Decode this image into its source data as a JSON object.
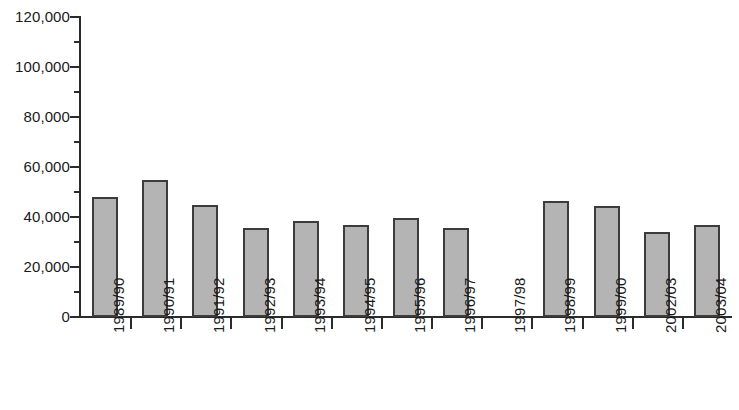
{
  "chart_data": {
    "type": "bar",
    "title": "",
    "subtitle": "",
    "xlabel": "",
    "ylabel": "",
    "grid": false,
    "legend": "none",
    "ylim": [
      0,
      120000
    ],
    "y_tick_step": 20000,
    "y_minor_tick_step": 10000,
    "y_ticks": [
      0,
      20000,
      40000,
      60000,
      80000,
      100000,
      120000
    ],
    "y_tick_labels": [
      "0",
      "20,000",
      "40,000",
      "60,000",
      "80,000",
      "100,000",
      "120,000"
    ],
    "categories": [
      "1989/90",
      "1990/91",
      "1991/92",
      "1992/93",
      "1993/94",
      "1994/95",
      "1995/96",
      "1996/97",
      "1997/98",
      "1998/99",
      "1999/00",
      "2002/03",
      "2003/04"
    ],
    "values": [
      48000,
      55000,
      45000,
      35500,
      38500,
      37000,
      39500,
      35500,
      null,
      46500,
      44500,
      34000,
      37000
    ],
    "series": [
      {
        "name": "",
        "values": [
          48000,
          55000,
          45000,
          35500,
          38500,
          37000,
          39500,
          35500,
          null,
          46500,
          44500,
          34000,
          37000
        ]
      }
    ],
    "missing_categories": [
      "1997/98"
    ],
    "bar_fill_color": "#b4b4b4",
    "bar_edge_color": "#3c3c3c",
    "axis_color": "#2b2b2b",
    "background_color": "#ffffff"
  }
}
